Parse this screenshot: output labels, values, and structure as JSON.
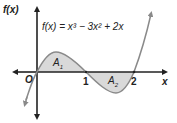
{
  "diagram": {
    "y_axis_label": "f(x)",
    "x_axis_label": "x",
    "origin_label": "O",
    "equation": "f(x) = x³ − 3x² + 2x",
    "tick_labels": [
      "1",
      "2"
    ],
    "regions": [
      {
        "label": "A",
        "subscript": "1",
        "interval": [
          0,
          1
        ],
        "sign": "above x-axis"
      },
      {
        "label": "A",
        "subscript": "2",
        "interval": [
          1,
          2
        ],
        "sign": "below x-axis"
      }
    ],
    "roots": [
      0,
      1,
      2
    ],
    "colors": {
      "axis": "#222222",
      "curve": "#8a8a8a",
      "shade": "#d9d9d9",
      "text": "#222222"
    }
  }
}
